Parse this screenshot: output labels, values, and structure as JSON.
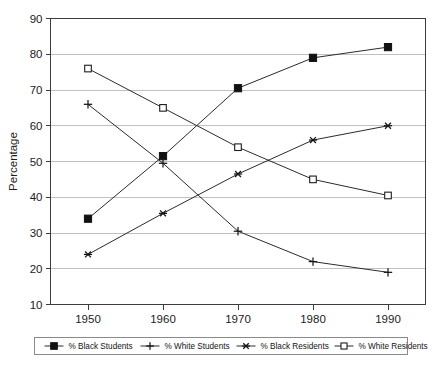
{
  "chart_data": {
    "type": "line",
    "title": "",
    "xlabel": "",
    "ylabel": "Percentage",
    "categories": [
      "1950",
      "1960",
      "1970",
      "1980",
      "1990"
    ],
    "x": [
      1950,
      1960,
      1970,
      1980,
      1990
    ],
    "ylim": [
      10,
      90
    ],
    "yticks": [
      "10",
      "20",
      "30",
      "40",
      "50",
      "60",
      "70",
      "80",
      "90"
    ],
    "ytick_values": [
      10,
      20,
      30,
      40,
      50,
      60,
      70,
      80,
      90
    ],
    "grid": true,
    "legend_position": "bottom",
    "series": [
      {
        "name": "% Black Students",
        "marker": "filled-square",
        "color": "#111111",
        "values": [
          34,
          51.5,
          70.5,
          79,
          82
        ]
      },
      {
        "name": "% White Students",
        "marker": "plus",
        "color": "#151515",
        "values": [
          66,
          49.5,
          30.5,
          22,
          19
        ]
      },
      {
        "name": "% Black Residents",
        "marker": "star",
        "color": "#151515",
        "values": [
          24,
          35.5,
          46.5,
          56,
          60
        ]
      },
      {
        "name": "% White Residents",
        "marker": "open-square",
        "color": "#1d1d1d",
        "values": [
          76,
          65,
          54,
          45,
          40.5
        ]
      }
    ]
  },
  "legend": {
    "items": [
      {
        "label": "% Black Students",
        "marker": "filled-square"
      },
      {
        "label": "% White Students",
        "marker": "plus"
      },
      {
        "label": "% Black Residents",
        "marker": "star"
      },
      {
        "label": "% White Residents",
        "marker": "open-square"
      }
    ]
  }
}
